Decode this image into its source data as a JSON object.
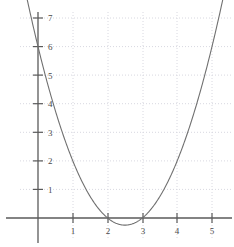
{
  "chart_data": {
    "type": "line",
    "title": "",
    "subtitle": "",
    "xlabel": "",
    "ylabel": "",
    "function": "y = x^2 - 5x + 6",
    "factored": "y = (x - 2)(x - 3)",
    "roots": [
      2,
      3
    ],
    "vertex": [
      2.5,
      -0.25
    ],
    "y_intercept": 6,
    "grid": true,
    "grid_style": "dotted",
    "legend": "none",
    "xlim": [
      -0.35,
      5.6
    ],
    "ylim": [
      -0.75,
      7.4
    ],
    "x_ticks": [
      1,
      2,
      3,
      4,
      5
    ],
    "y_ticks": [
      1,
      2,
      3,
      4,
      5,
      6,
      7
    ],
    "x_tick_labels": [
      "1",
      "2",
      "3",
      "4",
      "5"
    ],
    "y_tick_labels": [
      "1",
      "2",
      "3",
      "4",
      "5",
      "6",
      "7"
    ],
    "series": [
      {
        "name": "parabola",
        "color": "#707070",
        "x": [
          -0.35,
          -0.2,
          0,
          0.2,
          0.4,
          0.6,
          0.8,
          1.0,
          1.2,
          1.4,
          1.6,
          1.8,
          2.0,
          2.2,
          2.4,
          2.5,
          2.6,
          2.8,
          3.0,
          3.2,
          3.4,
          3.6,
          3.8,
          4.0,
          4.2,
          4.4,
          4.6,
          4.8,
          5.0,
          5.2,
          5.4,
          5.6
        ],
        "y": [
          7.87,
          7.04,
          6.0,
          5.04,
          4.16,
          3.36,
          2.64,
          2.0,
          1.44,
          0.96,
          0.56,
          0.24,
          0.0,
          -0.16,
          -0.24,
          -0.25,
          -0.24,
          -0.16,
          0.0,
          0.24,
          0.56,
          0.96,
          1.44,
          2.0,
          2.64,
          3.36,
          4.16,
          5.04,
          6.0,
          7.04,
          8.16,
          9.36
        ]
      }
    ],
    "colors": {
      "curve": "#707070",
      "axis": "#5a5a5a",
      "grid": "#d8d8e0",
      "tick_label": "#4a4a4a",
      "background": "#ffffff"
    },
    "axes": {
      "x_axis_visible": true,
      "y_axis_visible": true,
      "x_axis_value": 0,
      "y_axis_value": 0
    }
  }
}
